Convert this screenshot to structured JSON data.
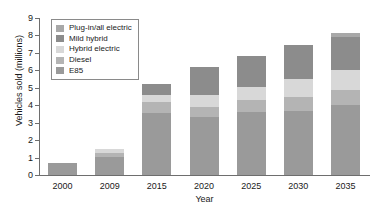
{
  "chart_data": {
    "type": "bar",
    "title": "",
    "subtitle": "",
    "xlabel": "Year",
    "ylabel": "Vehicles sold (millions)",
    "categories": [
      "2000",
      "2009",
      "2015",
      "2020",
      "2025",
      "2030",
      "2035"
    ],
    "ylim": [
      0,
      9
    ],
    "yticks": [
      0,
      1,
      2,
      3,
      4,
      5,
      6,
      7,
      8,
      9
    ],
    "ytick_labels": [
      "0",
      "1",
      "2",
      "3",
      "4",
      "5",
      "6",
      "7",
      "8",
      "9"
    ],
    "grid": false,
    "stacked": true,
    "legend_position": "upper-left-inside",
    "series": [
      {
        "name": "E85",
        "color": "#9a9a9a",
        "values": [
          0.7,
          1.05,
          3.55,
          3.35,
          3.6,
          3.65,
          4.0
        ]
      },
      {
        "name": "Diesel",
        "color": "#b4b4b4",
        "values": [
          0,
          0.2,
          0.65,
          0.55,
          0.7,
          0.85,
          0.85
        ]
      },
      {
        "name": "Hybrid electric",
        "color": "#d8d8d8",
        "values": [
          0,
          0.25,
          0.4,
          0.7,
          0.75,
          1.0,
          1.2
        ]
      },
      {
        "name": "Mild hybrid",
        "color": "#8c8c8c",
        "values": [
          0,
          0,
          0.6,
          1.6,
          1.75,
          1.95,
          1.85
        ]
      },
      {
        "name": "Plug-in/all electric",
        "color": "#a8a8a8",
        "values": [
          0,
          0,
          0,
          0,
          0,
          0,
          0.25
        ]
      }
    ],
    "totals": [
      0.7,
      1.5,
      5.2,
      6.2,
      6.8,
      7.45,
      8.15
    ]
  },
  "legend": {
    "items": [
      {
        "label": "Plug-in/all electric",
        "color": "#a8a8a8"
      },
      {
        "label": "Mild hybrid",
        "color": "#8c8c8c"
      },
      {
        "label": "Hybrid electric",
        "color": "#d8d8d8"
      },
      {
        "label": "Diesel",
        "color": "#b4b4b4"
      },
      {
        "label": "E85",
        "color": "#9a9a9a"
      }
    ]
  },
  "axes": {
    "axis_color": "#6e6e6e",
    "text_color": "#1a1a1a"
  }
}
